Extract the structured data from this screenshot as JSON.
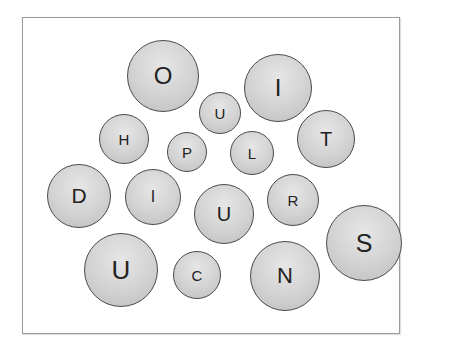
{
  "diagram": {
    "type": "bubble-letters",
    "bubbles": [
      {
        "letter": "O",
        "cx": 163,
        "cy": 76,
        "r": 36,
        "font": 24
      },
      {
        "letter": "U",
        "cx": 220,
        "cy": 113,
        "r": 21,
        "font": 15
      },
      {
        "letter": "I",
        "cx": 278,
        "cy": 88,
        "r": 34,
        "font": 24
      },
      {
        "letter": "H",
        "cx": 124,
        "cy": 139,
        "r": 25,
        "font": 15
      },
      {
        "letter": "P",
        "cx": 187,
        "cy": 152,
        "r": 20,
        "font": 15
      },
      {
        "letter": "L",
        "cx": 252,
        "cy": 153,
        "r": 22,
        "font": 15
      },
      {
        "letter": "T",
        "cx": 326,
        "cy": 139,
        "r": 29,
        "font": 20
      },
      {
        "letter": "D",
        "cx": 79,
        "cy": 196,
        "r": 32,
        "font": 21
      },
      {
        "letter": "I",
        "cx": 153,
        "cy": 197,
        "r": 28,
        "font": 16
      },
      {
        "letter": "U",
        "cx": 224,
        "cy": 214,
        "r": 30,
        "font": 20
      },
      {
        "letter": "R",
        "cx": 293,
        "cy": 200,
        "r": 26,
        "font": 15
      },
      {
        "letter": "S",
        "cx": 364,
        "cy": 243,
        "r": 38,
        "font": 25
      },
      {
        "letter": "U",
        "cx": 121,
        "cy": 270,
        "r": 37,
        "font": 26
      },
      {
        "letter": "C",
        "cx": 197,
        "cy": 275,
        "r": 24,
        "font": 15
      },
      {
        "letter": "N",
        "cx": 285,
        "cy": 276,
        "r": 35,
        "font": 22
      }
    ]
  }
}
